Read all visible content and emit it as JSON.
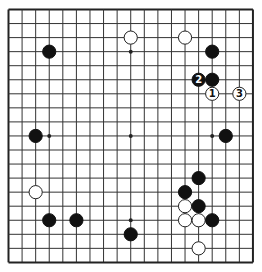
{
  "board": {
    "size": 19,
    "background": "#ffffff",
    "line_color": "#333333",
    "border_color": "#222222",
    "black_color": "#111111",
    "white_fill": "#ffffff",
    "white_stroke": "#222222",
    "origin_x": 8.5,
    "origin_y": 9.5,
    "spacing_x": 13.58,
    "spacing_y": 14.05,
    "stone_radius": 6.6,
    "star_points": [
      [
        9,
        3
      ],
      [
        3,
        9
      ],
      [
        9,
        9
      ],
      [
        15,
        9
      ],
      [
        9,
        15
      ]
    ],
    "stones": [
      {
        "color": "black",
        "col": 3,
        "row": 3
      },
      {
        "color": "white",
        "col": 9,
        "row": 2
      },
      {
        "color": "white",
        "col": 13,
        "row": 2
      },
      {
        "color": "black",
        "col": 15,
        "row": 3
      },
      {
        "color": "black",
        "col": 14,
        "row": 5,
        "label": "2"
      },
      {
        "color": "black",
        "col": 15,
        "row": 5
      },
      {
        "color": "white",
        "col": 15,
        "row": 6,
        "label": "1"
      },
      {
        "color": "white",
        "col": 17,
        "row": 6,
        "label": "3"
      },
      {
        "color": "black",
        "col": 2,
        "row": 9
      },
      {
        "color": "black",
        "col": 16,
        "row": 9
      },
      {
        "color": "white",
        "col": 2,
        "row": 13
      },
      {
        "color": "black",
        "col": 14,
        "row": 12
      },
      {
        "color": "black",
        "col": 13,
        "row": 13
      },
      {
        "color": "white",
        "col": 13,
        "row": 14
      },
      {
        "color": "black",
        "col": 14,
        "row": 14
      },
      {
        "color": "white",
        "col": 13,
        "row": 15
      },
      {
        "color": "white",
        "col": 14,
        "row": 15
      },
      {
        "color": "black",
        "col": 15,
        "row": 15
      },
      {
        "color": "black",
        "col": 3,
        "row": 15
      },
      {
        "color": "black",
        "col": 5,
        "row": 15
      },
      {
        "color": "black",
        "col": 9,
        "row": 16
      },
      {
        "color": "white",
        "col": 14,
        "row": 17
      }
    ]
  }
}
